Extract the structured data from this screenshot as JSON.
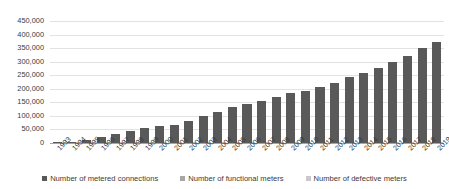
{
  "chart_data": {
    "type": "bar",
    "title": "",
    "subtitle": "",
    "xlabel": "",
    "ylabel": "",
    "ylim": [
      0,
      450000
    ],
    "ytick_interval": 50000,
    "ytick_labels": [
      "450,000",
      "400,000",
      "350,000",
      "300,000",
      "250,000",
      "200,000",
      "150,000",
      "100,000",
      "50,000",
      "0"
    ],
    "ytick_values": [
      450000,
      400000,
      350000,
      300000,
      250000,
      200000,
      150000,
      100000,
      50000,
      0
    ],
    "grid": true,
    "legend_position": "bottom",
    "categories": [
      "1993",
      "1994",
      "1995",
      "1996",
      "1997",
      "1998",
      "1999",
      "2000",
      "2001",
      "2002",
      "2003",
      "2004",
      "2005",
      "2006",
      "2007",
      "2008",
      "2009",
      "2010",
      "2011",
      "2012",
      "2013",
      "2014",
      "2015",
      "2016",
      "2017",
      "2018",
      "2019"
    ],
    "series": [
      {
        "name": "Number of metered connections",
        "color": "#595959",
        "values": [
          2000,
          3000,
          10000,
          23000,
          35000,
          44000,
          55000,
          61000,
          67000,
          82000,
          99000,
          115000,
          132000,
          145000,
          156000,
          168000,
          183000,
          193000,
          208000,
          223000,
          243000,
          260000,
          278000,
          300000,
          320000,
          352000,
          373000
        ]
      },
      {
        "name": "Number of functional meters",
        "color": "#a6a6a6",
        "values": [
          0,
          0,
          0,
          0,
          0,
          0,
          0,
          0,
          0,
          0,
          0,
          0,
          0,
          0,
          0,
          0,
          0,
          0,
          0,
          0,
          0,
          0,
          0,
          0,
          0,
          0,
          0
        ]
      },
      {
        "name": "Number of defective meters",
        "color": "#c9c9c9",
        "values": [
          0,
          0,
          0,
          0,
          0,
          0,
          0,
          0,
          0,
          0,
          0,
          0,
          0,
          0,
          0,
          0,
          0,
          0,
          0,
          0,
          0,
          0,
          0,
          0,
          0,
          0,
          0
        ]
      }
    ]
  }
}
